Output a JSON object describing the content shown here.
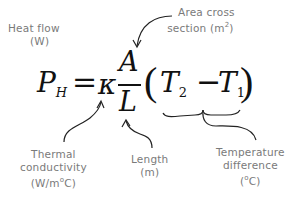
{
  "labels": {
    "heat_flow": {
      "line1": "Heat flow",
      "line2": "(W)"
    },
    "area": {
      "line1": "Area cross",
      "line2_prefix": "section (m",
      "line2_sup": "2",
      "line2_suffix": ")"
    },
    "thermal": {
      "line1": "Thermal",
      "line2": "conductivity",
      "line3_prefix": "(W/m",
      "line3_sup": "o",
      "line3_suffix": "C)"
    },
    "length": {
      "line1": "Length",
      "line2": "(m)"
    },
    "temperature": {
      "line1": "Temperature",
      "line2": "difference",
      "line3_prefix": "(",
      "line3_sup": "o",
      "line3_suffix": "C)"
    }
  },
  "equation": {
    "lhs": "P",
    "lhs_sub": "H",
    "equals": "=",
    "kappa": "κ",
    "numerator": "A",
    "denominator": "L",
    "open_paren": "(",
    "t2": "T",
    "t2_sub": "2",
    "minus": "−",
    "t1": "T",
    "t1_sub": "1",
    "close_paren": ")"
  },
  "colors": {
    "label_text": "#7a7a7a",
    "equation_text": "#111111",
    "arrows": "#222222",
    "background": "#ffffff"
  }
}
